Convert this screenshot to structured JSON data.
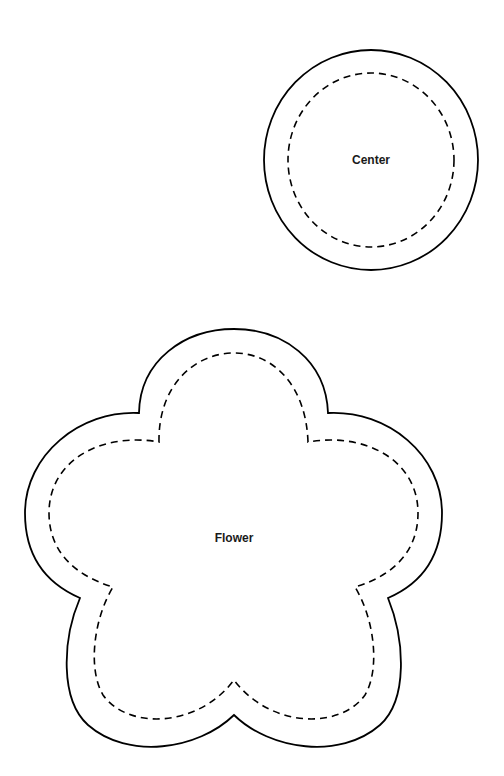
{
  "pieces": [
    {
      "name": "Center",
      "label": "Center",
      "shape": "circle",
      "outline": "solid cut line",
      "inner_outline": "dashed stitch line"
    },
    {
      "name": "Flower",
      "label": "Flower",
      "shape": "five-petal flower",
      "outline": "solid cut line",
      "inner_outline": "dashed stitch line"
    }
  ],
  "colors": {
    "background": "#ffffff",
    "line": "#000000",
    "text": "#1a1a1a"
  }
}
